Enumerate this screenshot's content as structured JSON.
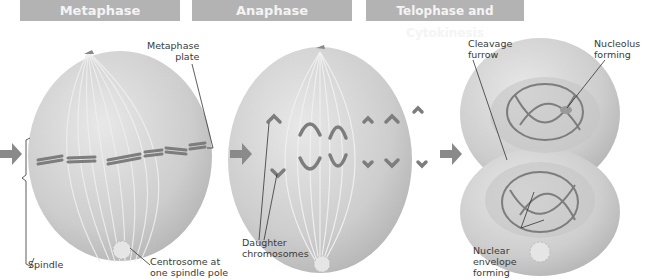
{
  "headers": [
    "Metaphase",
    "Anaphase",
    "Telophase and Cytokinesis"
  ],
  "labels": {
    "metaphase_plate": [
      "Metaphase",
      "plate"
    ],
    "spindle": "Spindle",
    "centrosome": [
      "Centrosome at",
      "one spindle pole"
    ],
    "daughter_chromosomes": [
      "Daughter",
      "chromosomes"
    ],
    "cleavage_furrow": [
      "Cleavage",
      "furrow"
    ],
    "nucleolus_forming": [
      "Nucleolus",
      "forming"
    ],
    "nuclear_envelope_forming": [
      "Nuclear",
      "envelope",
      "forming"
    ]
  },
  "colors": {
    "header_bg": "#b3b3b3",
    "cell_fill": "#cfcfcf",
    "chromosome": "#7d7d7d",
    "arrow": "#8a8a8a"
  }
}
